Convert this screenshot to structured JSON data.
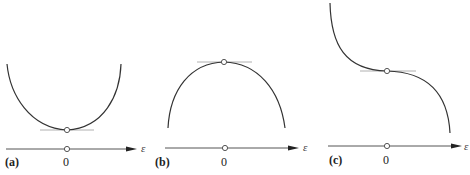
{
  "panels": [
    {
      "id": "a",
      "label": "(a)",
      "origin_label": "0",
      "axis_label": "ε",
      "description": "Convex curve with minimum at origin (stable equilibrium); horizontal tangent at minimum"
    },
    {
      "id": "b",
      "label": "(b)",
      "origin_label": "0",
      "axis_label": "ε",
      "description": "Concave curve with maximum at origin (unstable equilibrium); horizontal tangent at maximum"
    },
    {
      "id": "c",
      "label": "(c)",
      "origin_label": "0",
      "axis_label": "ε",
      "description": "Decreasing cubic-like curve with horizontal inflection at origin (neutral/critical point); horizontal tangent at inflection"
    }
  ],
  "colors": {
    "curve": "#333333",
    "tangent": "#b0b0b0",
    "axis": "#555555",
    "background": "#ffffff"
  }
}
